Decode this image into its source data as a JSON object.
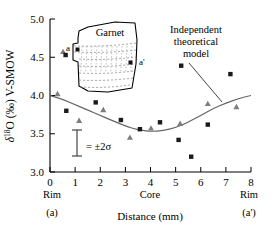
{
  "figure": {
    "name": "oxygen-isotope-garnet-traverse"
  },
  "chart_data": {
    "type": "scatter",
    "title": "",
    "xlabel": "Distance (mm)",
    "ylabel": "δ¹⁸O (‰) V-SMOW",
    "xlim": [
      0,
      8
    ],
    "ylim": [
      3.0,
      5.0
    ],
    "xticks": [
      0,
      1,
      2,
      3,
      4,
      5,
      6,
      7,
      8
    ],
    "yticks": [
      3.0,
      3.5,
      4.0,
      4.5,
      5.0
    ],
    "xticklabels": [
      "0",
      "1",
      "2",
      "3",
      "4",
      "5",
      "6",
      "7",
      "8"
    ],
    "yticklabels": [
      "3.0",
      "3.5",
      "4.0",
      "4.5",
      "5.0"
    ],
    "grid": false,
    "legend": "none",
    "series": [
      {
        "name": "squares",
        "marker": "square",
        "color": "#1a1a1a",
        "points": [
          {
            "x": 0.62,
            "y": 4.53
          },
          {
            "x": 0.65,
            "y": 3.8
          },
          {
            "x": 1.82,
            "y": 3.91
          },
          {
            "x": 2.82,
            "y": 3.68
          },
          {
            "x": 3.58,
            "y": 3.56
          },
          {
            "x": 4.38,
            "y": 3.65
          },
          {
            "x": 5.12,
            "y": 3.42
          },
          {
            "x": 5.22,
            "y": 4.39
          },
          {
            "x": 5.62,
            "y": 3.2
          },
          {
            "x": 6.28,
            "y": 3.62
          },
          {
            "x": 7.18,
            "y": 4.28
          }
        ]
      },
      {
        "name": "triangles",
        "marker": "triangle",
        "color": "#7d7d7d",
        "points": [
          {
            "x": 0.3,
            "y": 4.02
          },
          {
            "x": 0.52,
            "y": 4.57
          },
          {
            "x": 1.16,
            "y": 3.67
          },
          {
            "x": 2.12,
            "y": 3.81
          },
          {
            "x": 3.18,
            "y": 3.45
          },
          {
            "x": 4.02,
            "y": 3.57
          },
          {
            "x": 5.18,
            "y": 3.63
          },
          {
            "x": 6.28,
            "y": 3.89
          },
          {
            "x": 7.42,
            "y": 3.85
          }
        ]
      }
    ],
    "model_curve": {
      "name": "Independent theoretical model",
      "color": "#555555",
      "points": [
        {
          "x": 0.0,
          "y": 4.0
        },
        {
          "x": 0.5,
          "y": 3.95
        },
        {
          "x": 1.0,
          "y": 3.88
        },
        {
          "x": 1.5,
          "y": 3.81
        },
        {
          "x": 2.0,
          "y": 3.74
        },
        {
          "x": 2.5,
          "y": 3.67
        },
        {
          "x": 3.0,
          "y": 3.6
        },
        {
          "x": 3.5,
          "y": 3.55
        },
        {
          "x": 4.0,
          "y": 3.53
        },
        {
          "x": 4.5,
          "y": 3.54
        },
        {
          "x": 5.0,
          "y": 3.58
        },
        {
          "x": 5.5,
          "y": 3.65
        },
        {
          "x": 6.0,
          "y": 3.74
        },
        {
          "x": 6.5,
          "y": 3.83
        },
        {
          "x": 7.0,
          "y": 3.9
        },
        {
          "x": 7.5,
          "y": 3.96
        },
        {
          "x": 8.0,
          "y": 4.0
        }
      ]
    },
    "annotations": [
      {
        "name": "model-label",
        "text_lines": [
          "Independent",
          "theoretical",
          "model"
        ],
        "x": 5.6,
        "y": 4.72
      },
      {
        "name": "error-bar",
        "text": "= ±2σ",
        "x": 1.1,
        "y": 3.27,
        "half_height": 0.17
      }
    ],
    "axis_region_labels": {
      "left_top": "Rim",
      "left_bottom": "(a)",
      "center": "Core",
      "right_top": "Rim",
      "right_bottom": "(a')"
    }
  },
  "inset": {
    "name": "garnet-crystal-sketch",
    "title": "Garnet",
    "left_label": "a",
    "right_label": "a'",
    "zoning_line_count": 7
  }
}
